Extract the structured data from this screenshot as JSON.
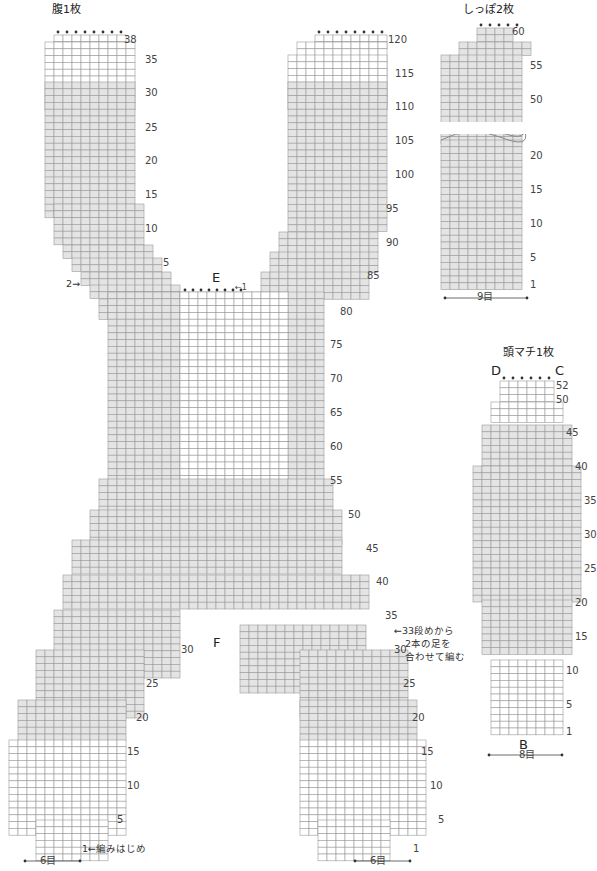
{
  "colors": {
    "grid_line": "#9a9a9a",
    "fill_shaded": "#e4e4e4",
    "fill_white": "#ffffff",
    "symbol": "#555555",
    "bindoff_dot": "#333333"
  },
  "labels": {
    "belly_title": "腹1枚",
    "tail_title": "しっぽ2枚",
    "gusset_title": "頭マチ1枚",
    "mark_E": "E",
    "mark_F": "F",
    "mark_B": "B",
    "mark_C": "C",
    "mark_D": "D",
    "start_note": "1←編みはじめ",
    "join_note_line1": "←33段めから",
    "join_note_line2": "2本の足を",
    "join_note_line3": "合わせて編む",
    "arrow_2": "2→",
    "arrow_1": "←1",
    "width_belly_left": "6目",
    "width_belly_right": "6目",
    "width_tail": "9目",
    "width_gusset": "8目"
  },
  "row_numbers": {
    "belly_left_leg": [
      "1",
      "5",
      "10",
      "15",
      "20",
      "25",
      "30"
    ],
    "belly_right_leg": [
      "1",
      "5",
      "10",
      "15",
      "20",
      "25",
      "30",
      "35",
      "40",
      "45",
      "50",
      "55",
      "60",
      "65",
      "70",
      "75",
      "80",
      "85",
      "90",
      "95",
      "100",
      "105",
      "110",
      "115",
      "120"
    ],
    "belly_left_top": [
      "5",
      "10",
      "15",
      "20",
      "25",
      "30",
      "35",
      "38"
    ],
    "tail": [
      "1",
      "5",
      "10",
      "15",
      "20",
      "50",
      "55",
      "60"
    ],
    "gusset": [
      "1",
      "5",
      "10",
      "15",
      "20",
      "25",
      "30",
      "35",
      "40",
      "45",
      "50",
      "52"
    ]
  },
  "legend": {
    "symbols": [
      {
        "name": "decrease-k2tog",
        "glyph": "⅄"
      },
      {
        "name": "increase-twisted",
        "glyph": "♎"
      },
      {
        "name": "bind-off",
        "glyph": "•"
      },
      {
        "name": "cable-cross",
        "glyph": "⨯"
      }
    ]
  }
}
